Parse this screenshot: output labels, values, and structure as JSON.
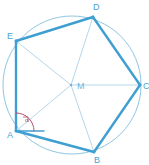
{
  "figure": {
    "colors": {
      "circle": "#8fc6e2",
      "polygon_edge": "#3f9fd0",
      "radius": "#b5d7ea",
      "vertex_label": "#4aa3cf",
      "center_label": "#6fb4d8",
      "angle_arc": "#b0506a",
      "angle_label": "#b0506a",
      "background": "#ffffff"
    },
    "circle": {
      "cx": 72,
      "cy": 85,
      "r": 69
    },
    "center": {
      "id": "M",
      "label": "M",
      "x": 71,
      "y": 85,
      "label_x": 77,
      "label_y": 89
    },
    "vertices": [
      {
        "id": "A",
        "label": "A",
        "x": 16,
        "y": 131,
        "label_x": 7,
        "label_y": 138
      },
      {
        "id": "B",
        "label": "B",
        "x": 94,
        "y": 152,
        "label_x": 94,
        "label_y": 163
      },
      {
        "id": "C",
        "label": "C",
        "x": 140,
        "y": 85,
        "label_x": 143,
        "label_y": 89
      },
      {
        "id": "D",
        "label": "D",
        "x": 93,
        "y": 17,
        "label_x": 93,
        "label_y": 10
      },
      {
        "id": "E",
        "label": "E",
        "x": 16,
        "y": 41,
        "label_x": 7,
        "label_y": 39
      }
    ],
    "polygon_edges": [
      {
        "from": "A",
        "to": "B"
      },
      {
        "from": "B",
        "to": "C"
      },
      {
        "from": "C",
        "to": "D"
      },
      {
        "from": "D",
        "to": "E"
      },
      {
        "from": "E",
        "to": "A"
      }
    ],
    "radii": [
      {
        "from": "M",
        "to": "A"
      },
      {
        "from": "M",
        "to": "B"
      },
      {
        "from": "M",
        "to": "C"
      },
      {
        "from": "M",
        "to": "D"
      },
      {
        "from": "M",
        "to": "E"
      }
    ],
    "chords": [
      {
        "from": "E",
        "to": "D"
      }
    ],
    "angle_marker": {
      "at_vertex": "A",
      "label": "α",
      "label_x": 25,
      "label_y": 122,
      "arc_radius": 18,
      "right_angle_tick": true,
      "ray_horizontal_end_x": 44,
      "ray_horizontal_end_y": 131
    }
  }
}
